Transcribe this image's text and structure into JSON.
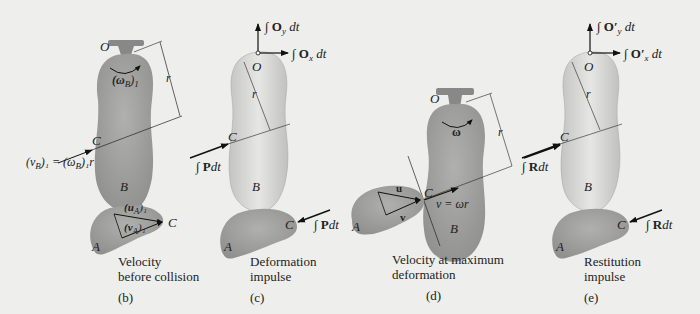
{
  "figure": {
    "background": "#eeeeec",
    "body_color": "#9a9a98",
    "body_light": "#d8d8d6",
    "panels": [
      {
        "id": "b",
        "label": "(b)",
        "caption_line1": "Velocity",
        "caption_line2": "before collision",
        "pivot": "O",
        "omega": "(ω",
        "omega_sub": "B",
        "omega_close": ")",
        "omega_post": "1",
        "r": "r",
        "point_c": "C",
        "point_b": "B",
        "point_a": "A",
        "point_c2": "C",
        "vb_eq": "(v",
        "vb_sub": "B",
        "vb_rest": ")₁ = (ω",
        "vb_sub2": "B",
        "vb_rest2": ")₁r",
        "ua": "(u",
        "ua_sub": "A",
        "ua_close": ")₁",
        "va": "(v",
        "va_sub": "A",
        "va_close": ")₁"
      },
      {
        "id": "c",
        "label": "(c)",
        "caption_line1": "Deformation",
        "caption_line2": "impulse",
        "pivot": "O",
        "oy": "∫ O",
        "oy_sub": "y",
        "oy_dt": " dt",
        "ox": "∫ O",
        "ox_sub": "x",
        "ox_dt": " dt",
        "r": "r",
        "point_c": "C",
        "point_b": "B",
        "point_a": "A",
        "point_c2": "C",
        "p_int": "∫ ",
        "p_vec": "P",
        "p_dt": "dt"
      },
      {
        "id": "d",
        "label": "(d)",
        "caption_line1": "Velocity at maximum",
        "caption_line2": "deformation",
        "pivot": "O",
        "omega": "ω",
        "r": "r",
        "point_c": "C",
        "point_b": "B",
        "point_a": "A",
        "u": "u",
        "v": "v",
        "v_eq": "v = ωr"
      },
      {
        "id": "e",
        "label": "(e)",
        "caption_line1": "Restitution",
        "caption_line2": "impulse",
        "pivot": "O",
        "oy": "∫ O′",
        "oy_sub": "y",
        "oy_dt": " dt",
        "ox": "∫ O′",
        "ox_sub": "x",
        "ox_dt": " dt",
        "r": "r",
        "point_c": "C",
        "point_b": "B",
        "point_a": "A",
        "point_c2": "C",
        "r_int": "∫ ",
        "r_vec": "R",
        "r_dt": "dt"
      }
    ]
  }
}
